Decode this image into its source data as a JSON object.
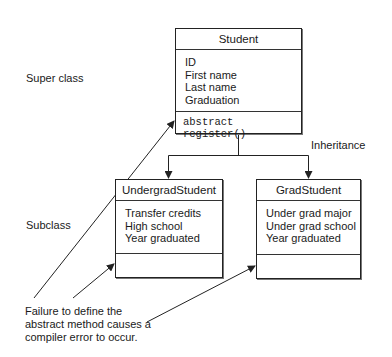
{
  "labels": {
    "super_class": "Super class",
    "subclass": "Subclass",
    "inheritance": "Inheritance"
  },
  "classes": {
    "student": {
      "name": "Student",
      "attributes": [
        "ID",
        "First name",
        "Last name",
        "Graduation"
      ],
      "methods": [
        "abstract register()"
      ]
    },
    "undergrad": {
      "name": "UndergradStudent",
      "attributes": [
        "Transfer credits",
        "High school",
        "Year graduated"
      ],
      "methods": []
    },
    "grad": {
      "name": "GradStudent",
      "attributes": [
        "Under grad major",
        "Under grad school",
        "Year graduated"
      ],
      "methods": []
    }
  },
  "note": {
    "lines": [
      "Failure to define the",
      "abstract method causes a",
      "compiler error to occur."
    ]
  },
  "colors": {
    "line": "#222222",
    "background": "#ffffff"
  }
}
